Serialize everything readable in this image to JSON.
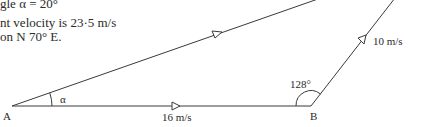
{
  "text_block": {
    "line1": "gle α = 20°",
    "line2": "nt velocity is 23·5 m/s",
    "line3": "on N 70° E."
  },
  "diagram": {
    "points": {
      "A": {
        "label": "A"
      },
      "B": {
        "label": "B"
      }
    },
    "angle_alpha_label": "α",
    "angle_B_label": "128°",
    "vector_AB_label": "16 m/s",
    "vector_BC_label": "10 m/s",
    "line_color": "#3a3a3a"
  }
}
